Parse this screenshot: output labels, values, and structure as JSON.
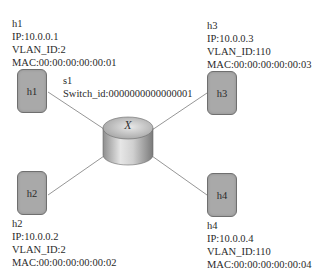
{
  "switch": {
    "name": "s1",
    "switch_id_label": "Switch_id:0000000000000001",
    "symbol": "X",
    "icon": "switch-cylinder-icon"
  },
  "hosts": [
    {
      "name": "h1",
      "box_label": "h1",
      "ip": "IP:10.0.0.1",
      "vlan": "VLAN_ID:2",
      "mac": "MAC:00:00:00:00:00:01"
    },
    {
      "name": "h2",
      "box_label": "h2",
      "ip": "IP:10.0.0.2",
      "vlan": "VLAN_ID:2",
      "mac": "MAC:00:00:00:00:00:02"
    },
    {
      "name": "h3",
      "box_label": "h3",
      "ip": "IP:10.0.0.3",
      "vlan": "VLAN_ID:110",
      "mac": "MAC:00:00:00:00:00:03"
    },
    {
      "name": "h4",
      "box_label": "h4",
      "ip": "IP:10.0.0.4",
      "vlan": "VLAN_ID:110",
      "mac": "MAC:00:00:00:00:00:04"
    }
  ],
  "links": [
    {
      "from": "h1",
      "to": "s1"
    },
    {
      "from": "h2",
      "to": "s1"
    },
    {
      "from": "h3",
      "to": "s1"
    },
    {
      "from": "h4",
      "to": "s1"
    }
  ],
  "colors": {
    "host_fill": "#a9a9a9",
    "host_border": "#6f6f6f",
    "link": "#8a8a8a",
    "switch_fill": "#c8c8c8"
  }
}
